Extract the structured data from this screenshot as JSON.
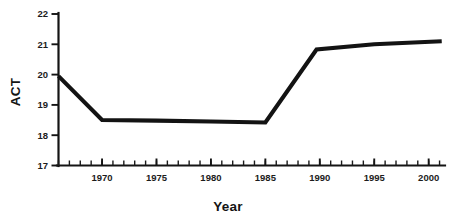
{
  "chart_data": {
    "type": "line",
    "title": "",
    "xlabel": "Year",
    "ylabel": "ACT",
    "xlim": [
      1966,
      2001.5
    ],
    "ylim": [
      17,
      22
    ],
    "grid": false,
    "legend": null,
    "x_tick_labels": [
      "1970",
      "1975",
      "1980",
      "1985",
      "1990",
      "1995",
      "2000"
    ],
    "x_tick_values": [
      1970,
      1975,
      1980,
      1985,
      1990,
      1995,
      2000
    ],
    "x_minor_tick_step": 1,
    "y_tick_labels": [
      "17",
      "18",
      "19",
      "20",
      "21",
      "22"
    ],
    "y_tick_values": [
      17,
      18,
      19,
      20,
      21,
      22
    ],
    "series": [
      {
        "name": "ACT composite score",
        "color": "#131313",
        "x": [
          1966,
          1970,
          1975,
          1980,
          1985,
          1989.7,
          1995,
          2001.2
        ],
        "values": [
          19.95,
          18.5,
          18.48,
          18.45,
          18.42,
          20.83,
          21.0,
          21.1
        ]
      }
    ]
  },
  "colors": {
    "line": "#131313",
    "axis": "#141414",
    "text": "#1c1c1c",
    "background": "#ffffff"
  }
}
